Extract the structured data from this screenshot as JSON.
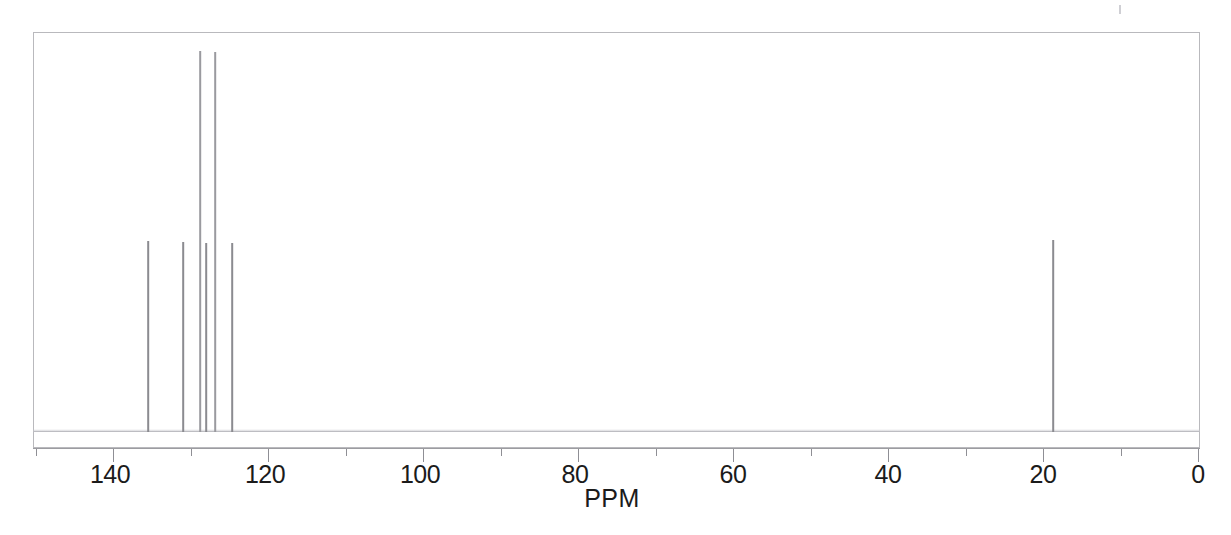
{
  "figure": {
    "kind": "nmr-spectrum",
    "nucleus_note": "carbon-13 decoupled stick spectrum",
    "background_color": "#ffffff",
    "trace_color": "#8b8b90",
    "axis_color": "#9c9ca1",
    "frame_color": "#b9b9bd"
  },
  "axis": {
    "title": "PPM",
    "title_x_px": 612,
    "labels": [
      {
        "text": "140",
        "value": 140,
        "x_px": 110
      },
      {
        "text": "120",
        "value": 120,
        "x_px": 265
      },
      {
        "text": "100",
        "value": 100,
        "x_px": 420
      },
      {
        "text": "80",
        "value": 80,
        "x_px": 575
      },
      {
        "text": "60",
        "value": 60,
        "x_px": 733
      },
      {
        "text": "40",
        "value": 40,
        "x_px": 888
      },
      {
        "text": "20",
        "value": 20,
        "x_px": 1043
      },
      {
        "text": "0",
        "value": 0,
        "x_px": 1198
      }
    ],
    "major_ticks": [
      140,
      120,
      100,
      80,
      60,
      40,
      20,
      0
    ],
    "minor_ticks": [
      150,
      130,
      110,
      90,
      70,
      50,
      30,
      10
    ],
    "direction": "reversed",
    "px_per_ppm": 7.75,
    "zero_x_px": 1198
  },
  "chart_data": {
    "type": "line",
    "title": "",
    "subtitle": "",
    "xlabel": "PPM",
    "ylabel": "",
    "xlim": [
      150.3,
      -0.25
    ],
    "ylim": [
      0,
      100
    ],
    "grid": false,
    "legend": null,
    "annotations": [],
    "series": [
      {
        "name": "13C NMR stick spectrum",
        "x": [
          135.4,
          130.9,
          128.8,
          128.0,
          126.8,
          124.6,
          18.7
        ],
        "values": [
          48.8,
          48.5,
          98.0,
          48.3,
          97.5,
          48.0,
          49.0
        ],
        "peaks": [
          {
            "ppm": 135.4,
            "x_px": 148,
            "intensity": 48.8,
            "top_y_px": 241,
            "tall": false
          },
          {
            "ppm": 130.9,
            "x_px": 183,
            "intensity": 48.5,
            "top_y_px": 242,
            "tall": false
          },
          {
            "ppm": 128.8,
            "x_px": 200,
            "intensity": 98.0,
            "top_y_px": 51,
            "tall": true
          },
          {
            "ppm": 128.0,
            "x_px": 206,
            "intensity": 48.3,
            "top_y_px": 243,
            "tall": false
          },
          {
            "ppm": 126.8,
            "x_px": 215,
            "intensity": 97.5,
            "top_y_px": 52,
            "tall": true
          },
          {
            "ppm": 124.6,
            "x_px": 232,
            "intensity": 48.0,
            "top_y_px": 243,
            "tall": false
          },
          {
            "ppm": 18.7,
            "x_px": 1053,
            "intensity": 49.0,
            "top_y_px": 240,
            "tall": false
          }
        ]
      }
    ]
  }
}
